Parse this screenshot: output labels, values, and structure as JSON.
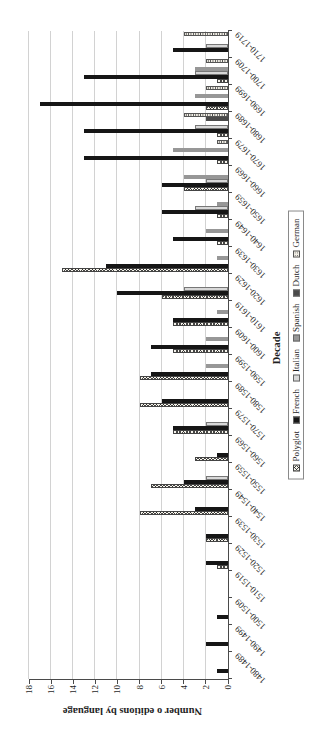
{
  "chart_data": {
    "type": "bar",
    "title": "",
    "xlabel": "Decade",
    "ylabel": "Number o editions by language",
    "ylim": [
      0,
      18
    ],
    "yticks": [
      0,
      2,
      4,
      6,
      8,
      10,
      12,
      14,
      16,
      18
    ],
    "grid": true,
    "legend_position": "bottom",
    "orientation_note": "vertical column chart rotated 90deg counterclockwise in screenshot",
    "categories": [
      "1480-1489",
      "1490-1499",
      "1500-1509",
      "1510-1519",
      "1520-1529",
      "1530-1539",
      "1540-1549",
      "1550-1559",
      "1560-1569",
      "1570-1579",
      "1580-1589",
      "1590-1599",
      "1600-1609",
      "1610-1619",
      "1620-1629",
      "1630-1639",
      "1640-1649",
      "1650-1659",
      "1660-1669",
      "1670-1679",
      "1680-1689",
      "1690-1699",
      "1700-1709",
      "1710-1719"
    ],
    "series": [
      {
        "name": "Polyglot",
        "pattern": "checker",
        "color": "#f6f4ec",
        "values": [
          0,
          0,
          0,
          0,
          1,
          2,
          8,
          7,
          3,
          5,
          8,
          8,
          5,
          5,
          6,
          15,
          1,
          1,
          4,
          1,
          1,
          2,
          1,
          0
        ]
      },
      {
        "name": "French",
        "pattern": "solid",
        "color": "#161616",
        "values": [
          1,
          2,
          1,
          0,
          2,
          2,
          3,
          4,
          1,
          5,
          6,
          7,
          7,
          5,
          10,
          11,
          5,
          6,
          6,
          13,
          13,
          17,
          13,
          5
        ]
      },
      {
        "name": "Italian",
        "pattern": "solid",
        "color": "#d8d8d8",
        "values": [
          0,
          0,
          0,
          0,
          0,
          0,
          0,
          2,
          0,
          2,
          0,
          0,
          0,
          0,
          4,
          0,
          0,
          3,
          2,
          0,
          3,
          0,
          3,
          2
        ]
      },
      {
        "name": "Spanish",
        "pattern": "solid",
        "color": "#979797",
        "values": [
          0,
          0,
          0,
          0,
          0,
          0,
          0,
          0,
          0,
          0,
          0,
          2,
          2,
          1,
          0,
          1,
          2,
          1,
          4,
          5,
          0,
          3,
          3,
          0
        ]
      },
      {
        "name": "Dutch",
        "pattern": "solid",
        "color": "#4a4a4a",
        "values": [
          0,
          0,
          0,
          0,
          0,
          0,
          0,
          0,
          0,
          0,
          0,
          0,
          0,
          0,
          0,
          0,
          0,
          0,
          0,
          0,
          2,
          0,
          0,
          0
        ]
      },
      {
        "name": "German",
        "pattern": "dots",
        "color": "#f3f0e7",
        "values": [
          0,
          0,
          0,
          0,
          0,
          0,
          0,
          0,
          0,
          0,
          0,
          0,
          0,
          0,
          0,
          0,
          0,
          0,
          0,
          1,
          4,
          2,
          2,
          4
        ]
      }
    ],
    "colors": {
      "gridline": "#d2d2d2",
      "axis_line": "#4a4a4a",
      "text": "#1f1f1f"
    }
  }
}
